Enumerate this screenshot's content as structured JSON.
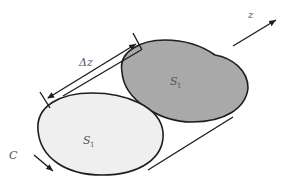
{
  "diagram": {
    "labels": {
      "back_surface": "S",
      "back_surface_sub": "1",
      "front_surface": "S",
      "front_surface_sub": "1",
      "delta_z": "Δz",
      "axis_z": "z",
      "contour": "C"
    },
    "colors": {
      "back_fill": "#a9a9a9",
      "front_fill": "#efefef",
      "stroke": "#1e1e1e",
      "label": "#555555"
    }
  }
}
